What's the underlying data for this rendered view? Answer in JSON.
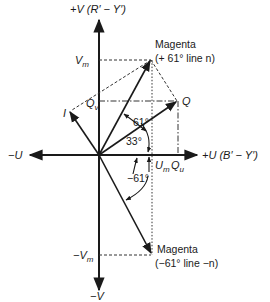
{
  "diagram": {
    "axes": {
      "v_pos": "+V (R′ − Y′)",
      "v_neg": "−V",
      "u_pos": "+U (B′ − Y′)",
      "u_neg": "−U"
    },
    "labels": {
      "magenta_pos_name": "Magenta",
      "magenta_pos_line": "(+ 61° line n)",
      "magenta_neg_name": "Magenta",
      "magenta_neg_line": "(−61° line −n)",
      "vm": "V",
      "vm_sub": "m",
      "neg_vm": "−V",
      "neg_vm_sub": "m",
      "um": "U",
      "um_sub": "m",
      "qu": "Q",
      "qu_sub": "u",
      "qv": "Q",
      "qv_sub": "v",
      "i_axis": "I",
      "q_axis": "Q",
      "angle_61": "61°",
      "angle_33": "33°",
      "angle_neg61": "−61°"
    },
    "colors": {
      "ink": "#1a1a1a",
      "background": "#ffffff"
    }
  }
}
